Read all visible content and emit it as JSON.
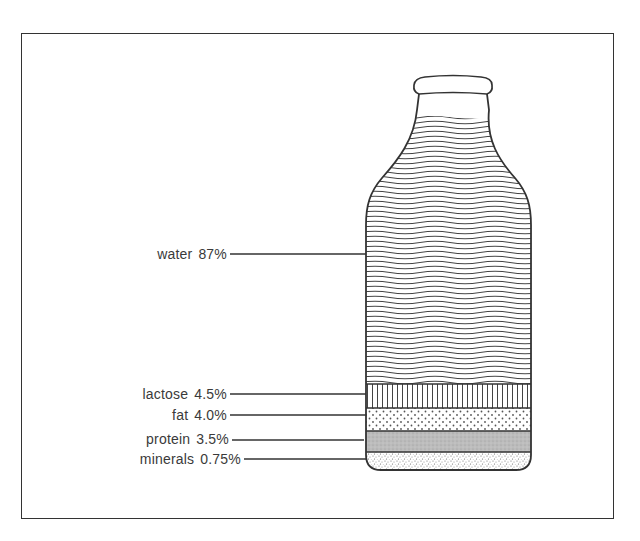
{
  "diagram": {
    "components": [
      {
        "id": "water",
        "name": "water",
        "value": "87%",
        "pattern": "wavy-lines"
      },
      {
        "id": "lactose",
        "name": "lactose",
        "value": "4.5%",
        "pattern": "vertical-lines"
      },
      {
        "id": "fat",
        "name": "fat",
        "value": "4.0%",
        "pattern": "dots"
      },
      {
        "id": "protein",
        "name": "protein",
        "value": "3.5%",
        "pattern": "grey-stipple"
      },
      {
        "id": "minerals",
        "name": "minerals",
        "value": "0.75%",
        "pattern": "fine-speckle"
      }
    ],
    "colors": {
      "line": "#333333",
      "text": "#3a3a3a",
      "protein_fill": "#b9b9b9",
      "background": "#ffffff"
    }
  }
}
